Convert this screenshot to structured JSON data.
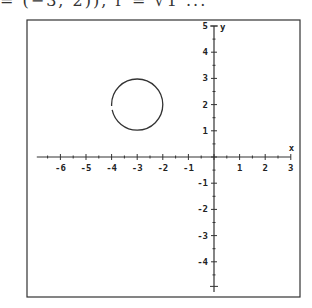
{
  "caption": {
    "text": "= (−3, 2)), r = √1 ..."
  },
  "chart_data": {
    "type": "line",
    "title": "",
    "xlabel": "x",
    "ylabel": "y",
    "xlim": [
      -7,
      3
    ],
    "ylim": [
      -5,
      5
    ],
    "x_ticks": [
      -6,
      -5,
      -4,
      -3,
      -2,
      -1,
      1,
      2,
      3
    ],
    "y_ticks": [
      -4,
      -3,
      -2,
      -1,
      1,
      2,
      3,
      4,
      5
    ],
    "minor_ticks": 0.5,
    "grid": false,
    "series": [
      {
        "name": "circle",
        "shape": "circle",
        "center": [
          -3,
          2
        ],
        "radius": 1,
        "color": "#333333"
      }
    ]
  },
  "axes": {
    "x_label": "x",
    "y_label": "y",
    "x_tick_labels": [
      "-6",
      "-5",
      "-4",
      "-3",
      "-2",
      "-1",
      "1",
      "2",
      "3"
    ],
    "y_tick_labels": [
      "5",
      "4",
      "3",
      "2",
      "1",
      "-1",
      "-2",
      "-3",
      "-4"
    ]
  }
}
